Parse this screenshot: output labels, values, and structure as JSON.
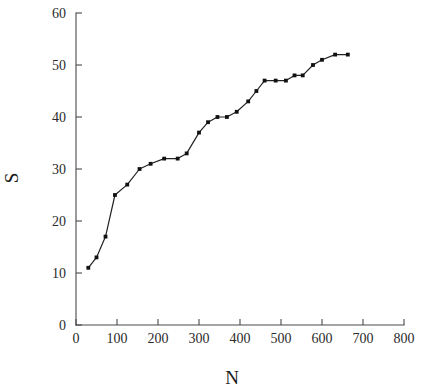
{
  "chart_data": {
    "type": "line",
    "title": "",
    "subtitle": "",
    "xlabel": "N",
    "ylabel": "S",
    "xlim": [
      0,
      800
    ],
    "ylim": [
      0,
      60
    ],
    "xticks": [
      0,
      100,
      200,
      300,
      400,
      500,
      600,
      700,
      800
    ],
    "yticks": [
      0,
      10,
      20,
      30,
      40,
      50,
      60
    ],
    "xtick_labels": [
      "0",
      "100",
      "200",
      "300",
      "400",
      "500",
      "600",
      "700",
      "800"
    ],
    "ytick_labels": [
      "0",
      "10",
      "20",
      "30",
      "40",
      "50",
      "60"
    ],
    "grid": false,
    "legend": null,
    "legend_position": "none",
    "marker": "filled-square",
    "line_color": "#222222",
    "marker_color": "#111111",
    "axis_color": "#4a4a4a",
    "background_color": "#ffffff",
    "series": [
      {
        "name": "S vs N",
        "x": [
          30,
          50,
          72,
          95,
          125,
          155,
          182,
          215,
          248,
          270,
          300,
          322,
          345,
          368,
          392,
          420,
          440,
          460,
          487,
          512,
          533,
          553,
          578,
          600,
          632,
          663
        ],
        "y": [
          11,
          13,
          17,
          25,
          27,
          30,
          31,
          32,
          32,
          33,
          37,
          39,
          40,
          40,
          41,
          43,
          45,
          47,
          47,
          47,
          48,
          48,
          50,
          51,
          52,
          52
        ],
        "points": [
          {
            "n": 30,
            "s": 11
          },
          {
            "n": 50,
            "s": 13
          },
          {
            "n": 72,
            "s": 17
          },
          {
            "n": 95,
            "s": 25
          },
          {
            "n": 125,
            "s": 27
          },
          {
            "n": 155,
            "s": 30
          },
          {
            "n": 182,
            "s": 31
          },
          {
            "n": 215,
            "s": 32
          },
          {
            "n": 248,
            "s": 32
          },
          {
            "n": 270,
            "s": 33
          },
          {
            "n": 300,
            "s": 37
          },
          {
            "n": 322,
            "s": 39
          },
          {
            "n": 345,
            "s": 40
          },
          {
            "n": 368,
            "s": 40
          },
          {
            "n": 392,
            "s": 41
          },
          {
            "n": 420,
            "s": 43
          },
          {
            "n": 440,
            "s": 45
          },
          {
            "n": 460,
            "s": 47
          },
          {
            "n": 487,
            "s": 47
          },
          {
            "n": 512,
            "s": 47
          },
          {
            "n": 533,
            "s": 48
          },
          {
            "n": 553,
            "s": 48
          },
          {
            "n": 578,
            "s": 50
          },
          {
            "n": 600,
            "s": 51
          },
          {
            "n": 632,
            "s": 52
          },
          {
            "n": 663,
            "s": 52
          }
        ]
      }
    ]
  }
}
